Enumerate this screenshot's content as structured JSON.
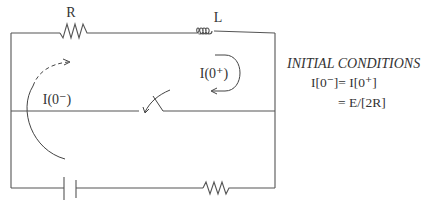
{
  "diagram": {
    "components": {
      "top_resistor": {
        "label": "R"
      },
      "inductor": {
        "label": "L"
      },
      "switch": {
        "state": "opening"
      },
      "capacitor": {
        "label": ""
      },
      "bottom_resistor": {
        "label": ""
      }
    },
    "currents": {
      "right_loop": {
        "label": "I(0⁺)"
      },
      "left_loop": {
        "label": "I(0⁻)"
      }
    },
    "initial_conditions": {
      "title": "INITIAL CONDITIONS",
      "line1": "I[0⁻]= I[0⁺]",
      "line2": "= E/[2R]"
    },
    "colors": {
      "line": "#555555",
      "text": "#333333",
      "background": "#ffffff"
    }
  }
}
